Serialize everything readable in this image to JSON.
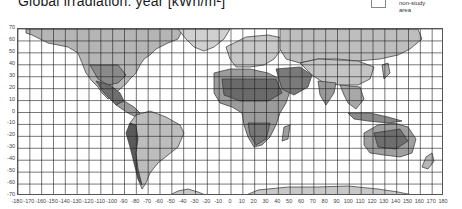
{
  "title": "Global irradiation: year [kWh/m²]",
  "legend": {
    "items": [
      {
        "label": "non-study area",
        "color": "#ffffff"
      }
    ]
  },
  "map": {
    "type": "world-choropleth-grayscale",
    "projection": "equirectangular",
    "lon_range": [
      -180,
      180
    ],
    "lat_range": [
      -70,
      70
    ],
    "grid_step_deg": 10,
    "ocean_color": "#ffffff",
    "land_shades": [
      "#d9d9d9",
      "#bfbfbf",
      "#a6a6a6",
      "#8c8c8c",
      "#737373",
      "#595959"
    ],
    "coastline_color": "#333333",
    "gridline_color": "#222222"
  },
  "axes": {
    "y_labels": [
      "70",
      "60",
      "50",
      "40",
      "30",
      "20",
      "10",
      "0",
      "-10",
      "-20",
      "-30",
      "-40",
      "-50",
      "-60",
      "-70"
    ],
    "x_labels": [
      "-180",
      "-170",
      "-160",
      "-150",
      "-140",
      "-130",
      "-120",
      "-110",
      "-100",
      "-90",
      "-80",
      "-70",
      "-60",
      "-50",
      "-40",
      "-30",
      "-20",
      "-10",
      "0",
      "10",
      "20",
      "30",
      "40",
      "50",
      "60",
      "70",
      "80",
      "90",
      "100",
      "110",
      "120",
      "130",
      "140",
      "150",
      "160",
      "170",
      "180"
    ]
  }
}
